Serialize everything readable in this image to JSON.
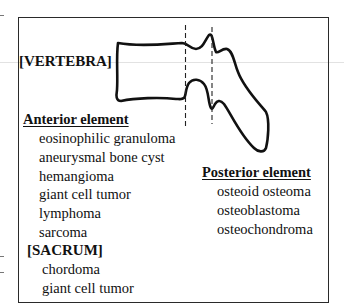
{
  "diagram": {
    "vertebra_label": "[VERTEBRA]",
    "anterior": {
      "heading": "Anterior element",
      "items": [
        "eosinophilic granuloma",
        "aneurysmal bone cyst",
        "hemangioma",
        "giant cell tumor",
        "lymphoma",
        "sarcoma"
      ]
    },
    "sacrum": {
      "heading": "[SACRUM]",
      "items": [
        "chordoma",
        "giant cell tumor"
      ]
    },
    "posterior": {
      "heading": "Posterior element",
      "items": [
        "osteoid osteoma",
        "osteoblastoma",
        "osteochondroma"
      ]
    },
    "shape": {
      "name": "vertebra-lateral-outline",
      "dividers": "two dashed vertical lines separating anterior and posterior elements"
    },
    "colors": {
      "line": "#111111",
      "frame": "#2a2a2a",
      "background": "#ffffff"
    }
  }
}
